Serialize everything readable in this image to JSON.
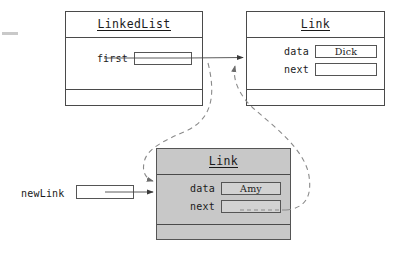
{
  "diagram": {
    "page_mark": "margin-rule-mark",
    "colors": {
      "stroke": "#4a4a4a",
      "text": "#1a1a1a",
      "shaded_fill": "#c8c8c8",
      "slot_fill_gray": "#d2d2d2",
      "background": "#ffffff"
    }
  },
  "linked_list_box": {
    "title": "LinkedList",
    "fields": [
      {
        "label": "first",
        "value": ""
      }
    ]
  },
  "link_box_top": {
    "title": "Link",
    "fields": [
      {
        "label": "data",
        "value": "Dick"
      },
      {
        "label": "next",
        "value": ""
      }
    ]
  },
  "link_box_new": {
    "title": "Link",
    "shaded": true,
    "fields": [
      {
        "label": "data",
        "value": "Amy"
      },
      {
        "label": "next",
        "value": ""
      }
    ]
  },
  "new_link_ref": {
    "label": "newLink",
    "value": ""
  },
  "connectors": [
    {
      "name": "first-to-dick-link",
      "style": "solid",
      "from": "linked-list.first",
      "to": "link-box-top"
    },
    {
      "name": "newlink-to-amy-link",
      "style": "solid",
      "from": "new-link-ref",
      "to": "link-box-new"
    },
    {
      "name": "first-to-amy-link-new",
      "style": "dashed",
      "from": "linked-list.first",
      "to": "link-box-new"
    },
    {
      "name": "amy-next-to-dick-link",
      "style": "dashed",
      "from": "link-box-new.next",
      "to": "link-box-top"
    }
  ]
}
